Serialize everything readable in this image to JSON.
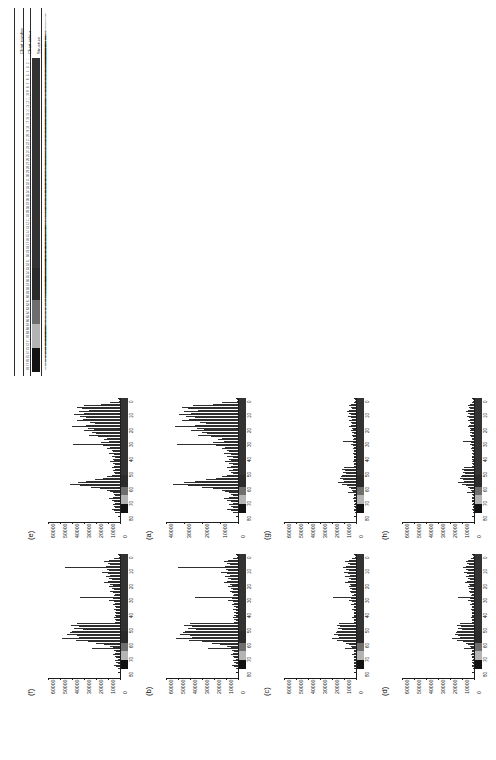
{
  "figure": {
    "orientation": "rotated-90-ccw",
    "caption_letters": [
      "(a)",
      "(b)",
      "(c)",
      "(d)",
      "(e)",
      "(f)",
      "(g)",
      "(h)"
    ]
  },
  "table": {
    "headers": [
      "Chart number",
      "Chart colour",
      "Structure"
    ],
    "row_numbers": [
      "1",
      "2",
      "3",
      "4",
      "5",
      "6",
      "7",
      "8",
      "9",
      "10",
      "11",
      "12",
      "13",
      "14",
      "15",
      "16",
      "17",
      "18",
      "19",
      "20",
      "21",
      "22",
      "23",
      "24",
      "25",
      "26",
      "27",
      "28",
      "29",
      "30",
      "31",
      "32",
      "33",
      "34",
      "35",
      "36",
      "37",
      "38",
      "39",
      "40",
      "41",
      "42",
      "43",
      "44",
      "45",
      "46",
      "47",
      "48",
      "49",
      "50",
      "51",
      "52",
      "53",
      "54",
      "55",
      "56",
      "57",
      "58",
      "59",
      "60",
      "61",
      "62",
      "63",
      "64",
      "65",
      "66",
      "67",
      "68",
      "69",
      "70",
      "71",
      "72",
      "73",
      "74",
      "75",
      "76",
      "77",
      "78"
    ],
    "structures": [
      "a-Man3Glc-5g6",
      "a-Man3Glc-5g13",
      "b-Man3Glc-5g6",
      "Neu5Ac2-3/9/6-3 Neu5Ac(a1-4)Neu(a1-3)GlcNAcb-5g6",
      "Neu5Ac3-3Galb1-3/4/6GlcNAcAc-5g6",
      "Neu5Ac3-3Galb1-4(6(OSO3)GlcNAc-5g6",
      "Neu5Ac2-3Galb1-4(Neu1-3)/6(OSO3)GlcNAcb-5g6",
      "Neu5Ac3-3Galb1-3/4/6(OSO3)GlcNAc-5g6",
      "Neu5Ac2-3Galb1-3(Neu1-3)GlcNAcb1-4GalNAc-5g16",
      "Neu5Ac2-3Galb1-3(Neu1-3)Neu5Ac2-5GalNAc-5g6",
      "Neu5Ac2-3Galb1-3Neu5Ac2-3Galb1-4GlcNAcb1-4GalNAc-5g4",
      "Neu5Ac2-3Galb1-3GlcNAcb-5g6",
      "Neu5Ac2-3Galb1-4GlcNAc-5g6",
      "Neu5Ac2-3Galb1-4Glc-5g6",
      "Neu5Ac2-3Galb-4GlcN-5g6",
      "Neu5Ac2-3Galb-5g6",
      "Neu5Ac2-3GalNAc-5g6",
      "Neu5Ac2-3GalNAcb-5g6",
      "Neu5Ac2-6Galb1-4GlcNAc-5g6",
      "Neu5Ac2-6Galb1-4Glc-5g6",
      "Neu5Ac2-6Galb1-4GlcNAcb-5g6",
      "Neu5Ac2-6GalNAc-5g6",
      "Neu5Ac2-6GalNAca-5g6",
      "Neu5Ac2-6GlcNAc-5g6",
      "Neu5Ac2-8Neu5Ac2-3Galb1-4GlcNAc-5g6",
      "Neu5Ac2-8Neu5Ac2-3Galb1-4Glc-5g6",
      "Neu5Ac2-8Neu5Ac-5g6",
      "Galb1-3(Neu5Ac2-6)GalNAc-5g6",
      "Galb1-3GalNAc-5g6",
      "Galb1-3GlcNAcb-5g6",
      "Galb1-4(Fuca1-3)GlcNAcb-5g6",
      "Galb1-4GlcNAcb-5g6",
      "Galb1-4Glcb-5g6",
      "Galb1-3(Fuca1-4)GlcNAcb-5g6",
      "Galb1-4(Fuca1-3)GlcNAcb1-3Galb-5g6",
      "Galb1-3GalNAca-5g6",
      "Fuca1-2Galb1-3GlcNAcb-5g6",
      "Fuca1-2Galb1-4GlcNAcb-5g6",
      "Fuca1-2Galb1-3GalNAc-5g6",
      "GalNAca1-3(Fuca1-2)Galb-5g6",
      "GalNAcb1-3Galb-5g6",
      "GlcNAcb1-3Galb1-4GlcNAcb-5g6",
      "GlcNAcb1-4GlcNAcb-5g6",
      "GlcNAcb1-6GalNAc-5g6",
      "Mana1-3(Mana1-6)Manb-5g6",
      "Mana1-6Manb-5g6",
      "Mana1-2Mana-5g6",
      "Manb1-4GlcNAcb-5g6",
      "Man3GlcNAc2-5g6",
      "Man5GlcNAc2-5g6",
      "Man6GlcNAc2-5g6",
      "Man9GlcNAc2-5g6",
      "Neu5Aca2-3Galb1-4GlcNAcb1-3Galb-5g6",
      "Neu5Aca2-3Galb1-4(Fuca1-3)GlcNAcb-5g6",
      "Neu5Aca2-6Galb1-4GlcNAcb1-3Galb-5g6",
      "Neu5Gca2-3Galb1-4GlcNAcb-5g6",
      "Neu5Gca2-6Galb1-4GlcNAcb-5g6",
      "Neu5Gca2-3Galb1-4Glcb-5g6",
      "Fuca1-3GlcNAcb-5g6",
      "Fuca1-4GlcNAcb-5g6",
      "Galb1-4GlcNAcb1-6(Galb1-3)GalNAc-5g6",
      "GalNAcb1-4GlcNAcb-5g6",
      "GalNAcb1-4(Neu5Aca2-3)Galb1-4GlcNAcb-5g6",
      "Galb1-3(Neu5Aca2-6)GlcNAcb-5g6",
      "Neu5Aca2-3Galb1-3(Neu5Aca2-6)GalNAc-5g6",
      "Neu5Aca2-3Galb1-3GalNAcb1-4Galb-5g6",
      "Glca1-4Glcb-5g6",
      "Glcb1-4Glcb-5g6",
      "Glcb1-3Glcb-5g6",
      "Glcb1-6Glcb-5g6",
      "Xylb1-4Glcb-5g6",
      "GlcAb1-3Galb-5g6",
      "GlcAb1-3GlcNAcb-5g6",
      "IdoAa1-3GalNAcb-5g6",
      "GlcNAc6S b1-3Galb-5g6",
      "Galb1-4GlcNAc6S b-5g6",
      "Neu5Aca2-3Galb1-4GlcNAc6S b-5g6",
      "Neu5Aca2-6Galb1-4GlcNAc6S b-5g6"
    ],
    "colour_band": {
      "segments": [
        {
          "from": 1,
          "to": 52,
          "color": "#333333"
        },
        {
          "from": 53,
          "to": 60,
          "color": "#2b2b2b"
        },
        {
          "from": 61,
          "to": 66,
          "color": "#6e6e6e"
        },
        {
          "from": 67,
          "to": 72,
          "color": "#b4b4b4"
        },
        {
          "from": 73,
          "to": 78,
          "color": "#121212"
        }
      ]
    }
  },
  "chart_data": {
    "type": "bar",
    "shared": {
      "xlabel": "Chart number",
      "ylabel": "Fluorescence intensity",
      "xlim": [
        0,
        85
      ],
      "x_ticks": [
        "0",
        "10",
        "20",
        "30",
        "40",
        "50",
        "60",
        "70",
        "80"
      ],
      "grid": false,
      "bar_color": "#2f2f2f"
    },
    "panels": [
      {
        "label": "(a)",
        "ylim": [
          0,
          40000
        ],
        "y_ticks": [
          "40000",
          "30000",
          "20000",
          "10000",
          "0"
        ],
        "values": [
          1200,
          800,
          600,
          9000,
          14000,
          25000,
          31000,
          28000,
          22000,
          30000,
          26000,
          33000,
          29000,
          24000,
          27000,
          31000,
          21000,
          18000,
          24000,
          35000,
          23000,
          19000,
          26000,
          20000,
          17000,
          22000,
          15000,
          9000,
          11000,
          8000,
          14000,
          34000,
          12000,
          7000,
          9000,
          6000,
          5000,
          8000,
          4000,
          6000,
          3000,
          5000,
          4000,
          7000,
          5000,
          3000,
          4000,
          6000,
          3000,
          5000,
          4000,
          3000,
          6000,
          9000,
          12000,
          18000,
          24000,
          30000,
          36000,
          28000,
          20000,
          14000,
          9000,
          7000,
          5000,
          4000,
          3000,
          5000,
          8000,
          6000,
          4000,
          3000,
          5000,
          4000,
          3000,
          6000,
          4000,
          3000
        ]
      },
      {
        "label": "(b)",
        "ylim": [
          0,
          60000
        ],
        "y_ticks": [
          "60000",
          "50000",
          "40000",
          "30000",
          "20000",
          "10000",
          "0"
        ],
        "values": [
          900,
          600,
          500,
          4000,
          8000,
          12000,
          9000,
          7000,
          11000,
          50000,
          10000,
          8000,
          14000,
          9000,
          7000,
          11000,
          8000,
          6000,
          9000,
          12000,
          7000,
          5000,
          8000,
          6000,
          4000,
          7000,
          5000,
          3000,
          4000,
          36000,
          5000,
          8000,
          4000,
          3000,
          5000,
          3000,
          2000,
          4000,
          2000,
          3000,
          2000,
          3000,
          2000,
          4000,
          3000,
          2000,
          3000,
          40000,
          45000,
          38000,
          42000,
          35000,
          44000,
          46000,
          48000,
          40000,
          38000,
          52000,
          41000,
          30000,
          22000,
          15000,
          9000,
          6000,
          25000,
          5000,
          3000,
          4000,
          6000,
          4000,
          3000,
          2000,
          4000,
          3000,
          2000,
          5000,
          3000,
          2000
        ]
      },
      {
        "label": "(c)",
        "ylim": [
          0,
          60000
        ],
        "y_ticks": [
          "60000",
          "50000",
          "40000",
          "30000",
          "20000",
          "10000",
          "0"
        ],
        "values": [
          700,
          500,
          400,
          3000,
          6000,
          9000,
          7000,
          5000,
          8000,
          11000,
          8000,
          6000,
          10000,
          7000,
          5000,
          9000,
          6000,
          4000,
          7000,
          9000,
          5000,
          4000,
          6000,
          5000,
          3000,
          5000,
          4000,
          2000,
          3000,
          19000,
          4000,
          6000,
          3000,
          2000,
          4000,
          2000,
          2000,
          3000,
          2000,
          2000,
          2000,
          2000,
          2000,
          3000,
          2000,
          2000,
          2000,
          14000,
          16000,
          13000,
          15000,
          12000,
          16000,
          17000,
          18000,
          15000,
          14000,
          20000,
          16000,
          11000,
          8000,
          6000,
          4000,
          3000,
          9000,
          2000,
          2000,
          2000,
          3000,
          2000,
          2000,
          1500,
          2000,
          1500,
          1500,
          2000,
          1500,
          1500
        ]
      },
      {
        "label": "(d)",
        "ylim": [
          0,
          60000
        ],
        "y_ticks": [
          "60000",
          "50000",
          "40000",
          "30000",
          "20000",
          "10000",
          "0"
        ],
        "values": [
          600,
          400,
          300,
          2500,
          5000,
          7000,
          5500,
          4000,
          6500,
          9000,
          6500,
          5000,
          8000,
          5500,
          4000,
          7000,
          5000,
          3500,
          5500,
          7500,
          4000,
          3000,
          5000,
          4000,
          2500,
          4000,
          3000,
          2000,
          2500,
          13000,
          3000,
          5000,
          2500,
          2000,
          3000,
          2000,
          1500,
          2500,
          1500,
          2000,
          1500,
          2000,
          1500,
          2500,
          2000,
          1500,
          2000,
          12000,
          14000,
          11000,
          13000,
          10000,
          14000,
          15000,
          16000,
          13000,
          12000,
          18000,
          14000,
          9000,
          7000,
          5000,
          3500,
          2500,
          8000,
          2000,
          1500,
          2000,
          2500,
          2000,
          1500,
          1200,
          2000,
          1500,
          1200,
          2000,
          1500,
          1200
        ]
      },
      {
        "label": "(e)",
        "ylim": [
          0,
          60000
        ],
        "y_ticks": [
          "60000",
          "50000",
          "40000",
          "30000",
          "20000",
          "10000",
          "0"
        ],
        "values": [
          1000,
          700,
          500,
          8000,
          16000,
          30000,
          36000,
          32000,
          26000,
          34000,
          30000,
          38000,
          33000,
          28000,
          31000,
          36000,
          25000,
          21000,
          28000,
          40000,
          27000,
          22000,
          30000,
          23000,
          20000,
          26000,
          18000,
          11000,
          13000,
          9000,
          16000,
          39000,
          14000,
          8000,
          11000,
          7000,
          6000,
          9000,
          5000,
          7000,
          4000,
          6000,
          5000,
          8000,
          6000,
          4000,
          5000,
          7000,
          4000,
          6000,
          5000,
          4000,
          7000,
          11000,
          14000,
          21000,
          28000,
          35000,
          42000,
          33000,
          24000,
          17000,
          11000,
          8000,
          6000,
          5000,
          4000,
          6000,
          9000,
          7000,
          5000,
          4000,
          6000,
          5000,
          4000,
          7000,
          5000,
          4000
        ]
      },
      {
        "label": "(f)",
        "ylim": [
          0,
          60000
        ],
        "y_ticks": [
          "60000",
          "50000",
          "40000",
          "30000",
          "20000",
          "10000",
          "0"
        ],
        "values": [
          800,
          500,
          400,
          5000,
          9000,
          13000,
          10000,
          8000,
          12000,
          46000,
          11000,
          9000,
          15000,
          10000,
          8000,
          12000,
          9000,
          7000,
          10000,
          13000,
          8000,
          6000,
          9000,
          7000,
          5000,
          8000,
          6000,
          4000,
          5000,
          33000,
          6000,
          9000,
          5000,
          4000,
          6000,
          4000,
          3000,
          5000,
          3000,
          4000,
          3000,
          4000,
          3000,
          5000,
          4000,
          3000,
          4000,
          36000,
          41000,
          34000,
          38000,
          31000,
          40000,
          42000,
          44000,
          36000,
          34000,
          48000,
          37000,
          27000,
          20000,
          13000,
          8000,
          6000,
          23000,
          5000,
          3000,
          4000,
          6000,
          4000,
          3000,
          2000,
          4000,
          3000,
          2000,
          5000,
          3000,
          2000
        ]
      },
      {
        "label": "(g)",
        "ylim": [
          0,
          60000
        ],
        "y_ticks": [
          "60000",
          "50000",
          "40000",
          "30000",
          "20000",
          "10000",
          "0"
        ],
        "values": [
          500,
          350,
          250,
          2000,
          4000,
          6000,
          4500,
          3500,
          5500,
          7500,
          5500,
          4000,
          6500,
          4500,
          3500,
          6000,
          4000,
          3000,
          4500,
          6000,
          3500,
          2500,
          4000,
          3500,
          2000,
          3500,
          2500,
          1800,
          2200,
          11000,
          2500,
          4000,
          2200,
          1800,
          2500,
          1800,
          1400,
          2200,
          1400,
          1800,
          1400,
          1800,
          1400,
          2200,
          1800,
          1400,
          1800,
          10000,
          11500,
          9500,
          10500,
          8500,
          11500,
          12500,
          13500,
          11000,
          10000,
          15000,
          11500,
          7500,
          6000,
          4000,
          3000,
          2200,
          7000,
          1800,
          1400,
          1800,
          2200,
          1800,
          1400,
          1100,
          1800,
          1400,
          1100,
          1800,
          1400,
          1100
        ]
      },
      {
        "label": "(h)",
        "ylim": [
          0,
          60000
        ],
        "y_ticks": [
          "60000",
          "50000",
          "40000",
          "30000",
          "20000",
          "10000",
          "0"
        ],
        "values": [
          450,
          300,
          220,
          1800,
          3500,
          5200,
          4000,
          3000,
          4800,
          6500,
          4800,
          3500,
          5600,
          4000,
          3000,
          5200,
          3500,
          2600,
          4000,
          5200,
          3000,
          2200,
          3500,
          3000,
          1800,
          3000,
          2200,
          1500,
          1900,
          9500,
          2200,
          3500,
          1900,
          1500,
          2200,
          1500,
          1200,
          1900,
          1200,
          1500,
          1200,
          1500,
          1200,
          1900,
          1500,
          1200,
          1500,
          8500,
          10000,
          8200,
          9000,
          7400,
          10000,
          10800,
          11600,
          9500,
          8600,
          13000,
          10000,
          6500,
          5200,
          3500,
          2600,
          1900,
          6000,
          1500,
          1200,
          1500,
          1900,
          1500,
          1200,
          950,
          1500,
          1200,
          950,
          1500,
          1200,
          950
        ]
      }
    ]
  }
}
